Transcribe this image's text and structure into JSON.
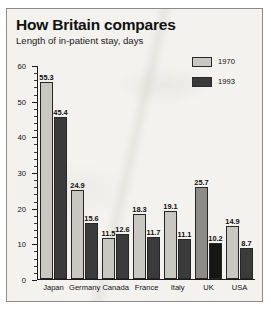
{
  "chart_data": {
    "type": "bar",
    "title": "How Britain compares",
    "subtitle": "Length of in-patient stay, days",
    "xlabel": "",
    "ylabel": "",
    "ylim": [
      0,
      60
    ],
    "yticks": [
      0,
      10,
      20,
      30,
      40,
      50,
      60
    ],
    "ytick_labels": [
      "0",
      "10",
      "20",
      "30",
      "40",
      "50",
      "60"
    ],
    "minor_tick_step": 2,
    "grid": false,
    "legend_position": "top-right",
    "highlight_category": "UK",
    "categories": [
      "Japan",
      "Germany",
      "Canada",
      "France",
      "Italy",
      "UK",
      "USA"
    ],
    "series": [
      {
        "name": "1970",
        "color": "#c9c7c2",
        "highlight_color": "#8e8c88",
        "values": [
          55.3,
          24.9,
          11.5,
          18.3,
          19.1,
          25.7,
          14.9
        ]
      },
      {
        "name": "1993",
        "color": "#3b3b3b",
        "highlight_color": "#161616",
        "values": [
          45.4,
          15.6,
          12.6,
          11.7,
          11.1,
          10.2,
          8.7
        ]
      }
    ]
  },
  "legend": [
    {
      "label": "1970",
      "swatch": "light-gray"
    },
    {
      "label": "1993",
      "swatch": "dark-gray"
    }
  ]
}
